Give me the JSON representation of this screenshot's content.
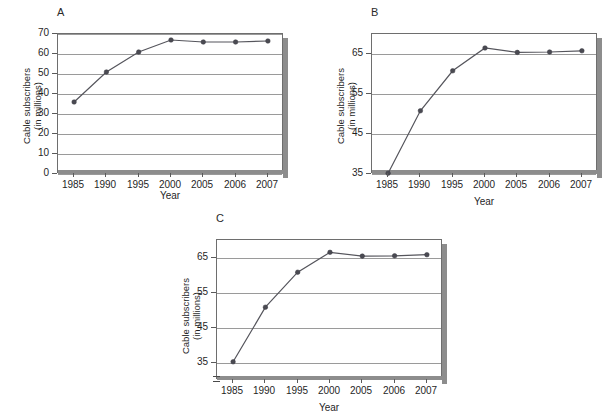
{
  "figure": {
    "axis_label_y_line1": "Cable subscribers",
    "axis_label_y_line2": "(in millions)",
    "axis_label_x": "Year",
    "line_color": "#55555c",
    "marker_color": "#4a4a52",
    "grid_color": "#9a9a9a",
    "frame_color": "#6e6e6e",
    "shadow_color": "#8d8d8d",
    "background": "#ffffff"
  },
  "panels": [
    {
      "letter": "A"
    },
    {
      "letter": "B"
    },
    {
      "letter": "C"
    }
  ],
  "chart_data": [
    {
      "type": "line",
      "title": "A",
      "xlabel": "Year",
      "ylabel": "Cable subscribers (in millions)",
      "categories": [
        "1985",
        "1990",
        "1995",
        "2000",
        "2005",
        "2006",
        "2007"
      ],
      "values": [
        36,
        51,
        61,
        67,
        66,
        66,
        66.5
      ],
      "yticks": [
        0,
        10,
        20,
        30,
        40,
        50,
        60,
        70
      ],
      "ylim": [
        0,
        70
      ],
      "grid": true,
      "legend": "none",
      "axis_break": false
    },
    {
      "type": "line",
      "title": "B",
      "xlabel": "Year",
      "ylabel": "Cable subscribers (in millions)",
      "categories": [
        "1985",
        "1990",
        "1995",
        "2000",
        "2005",
        "2006",
        "2007"
      ],
      "values": [
        35.2,
        50.8,
        60.8,
        66.5,
        65.4,
        65.5,
        65.8
      ],
      "yticks": [
        35,
        45,
        55,
        65
      ],
      "ylim": [
        35,
        70
      ],
      "grid": true,
      "legend": "none",
      "axis_break": false
    },
    {
      "type": "line",
      "title": "C",
      "xlabel": "Year",
      "ylabel": "Cable subscribers (in millions)",
      "categories": [
        "1985",
        "1990",
        "1995",
        "2000",
        "2005",
        "2006",
        "2007"
      ],
      "values": [
        35.2,
        50.8,
        60.8,
        66.5,
        65.4,
        65.5,
        65.8
      ],
      "yticks": [
        35,
        45,
        55,
        65
      ],
      "ylim": [
        30,
        70
      ],
      "grid": true,
      "legend": "none",
      "axis_break": true,
      "axis_break_note": "scale break below 35"
    }
  ]
}
